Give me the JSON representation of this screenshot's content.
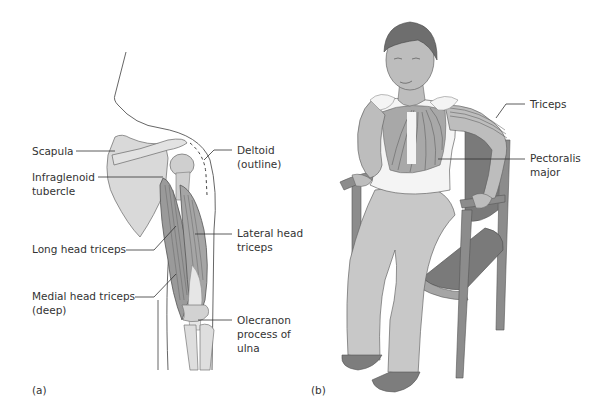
{
  "figure": {
    "panel_a": {
      "caption": "(a)",
      "labels": {
        "scapula": "Scapula",
        "infraglenoid_1": "Infraglenoid",
        "infraglenoid_2": "tubercle",
        "deltoid_1": "Deltoid",
        "deltoid_2": "(outline)",
        "long_head": "Long head triceps",
        "lateral_head_1": "Lateral head",
        "lateral_head_2": "triceps",
        "medial_head_1": "Medial head triceps",
        "medial_head_2": "(deep)",
        "olecranon_1": "Olecranon",
        "olecranon_2": "process of",
        "olecranon_3": "ulna"
      }
    },
    "panel_b": {
      "caption": "(b)",
      "labels": {
        "triceps": "Triceps",
        "pectoralis_1": "Pectoralis",
        "pectoralis_2": "major"
      }
    },
    "colors": {
      "bone": "#d9d9d9",
      "muscle": "#9a9a9a",
      "skin": "#bdbdbd",
      "hair": "#6e6e6e",
      "pants": "#c8c8c8",
      "chair": "#8c8c8c",
      "chair_seat": "#7a7a7a",
      "shoes": "#7d7d7d",
      "line": "#444444"
    }
  }
}
